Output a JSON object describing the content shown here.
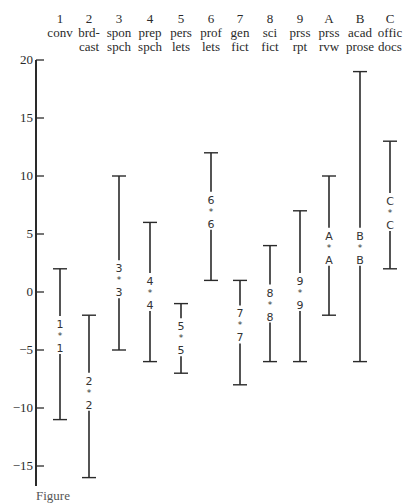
{
  "chart_data": {
    "type": "range",
    "title": "",
    "xlabel": "",
    "ylabel": "",
    "ylim": [
      -17,
      20
    ],
    "yticks": [
      20,
      15,
      10,
      5,
      0,
      -5,
      -10,
      -15
    ],
    "grid": false,
    "categories": [
      {
        "code": "1",
        "line1": "conv",
        "line2": "",
        "max": 2,
        "mean": -3.7,
        "min": -11
      },
      {
        "code": "2",
        "line1": "brd-",
        "line2": "cast",
        "max": -2,
        "mean": -8.6,
        "min": -16
      },
      {
        "code": "3",
        "line1": "spon",
        "line2": "spch",
        "max": 10,
        "mean": 1.1,
        "min": -5
      },
      {
        "code": "4",
        "line1": "prep",
        "line2": "spch",
        "max": 6,
        "mean": 0.0,
        "min": -6
      },
      {
        "code": "5",
        "line1": "pers",
        "line2": "lets",
        "max": -1,
        "mean": -3.9,
        "min": -7
      },
      {
        "code": "6",
        "line1": "prof",
        "line2": "lets",
        "max": 12,
        "mean": 7.0,
        "min": 1
      },
      {
        "code": "7",
        "line1": "gen",
        "line2": "fict",
        "max": 1,
        "mean": -2.8,
        "min": -8
      },
      {
        "code": "8",
        "line1": "sci",
        "line2": "fict",
        "max": 4,
        "mean": -1.0,
        "min": -6
      },
      {
        "code": "9",
        "line1": "prss",
        "line2": "rpt",
        "max": 7,
        "mean": 0.0,
        "min": -6
      },
      {
        "code": "A",
        "line1": "prss",
        "line2": "rvw",
        "max": 10,
        "mean": 3.9,
        "min": -2
      },
      {
        "code": "B",
        "line1": "acad",
        "line2": "prose",
        "max": 19,
        "mean": 3.9,
        "min": -6
      },
      {
        "code": "C",
        "line1": "offic",
        "line2": "docs",
        "max": 13,
        "mean": 6.9,
        "min": 2
      }
    ],
    "marker_symbol": "*"
  },
  "caption": "Figure"
}
